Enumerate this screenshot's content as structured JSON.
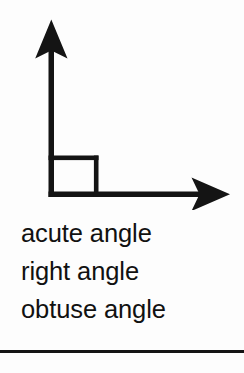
{
  "page": {
    "background_color": "#fdfdfd",
    "ink_color": "#111111",
    "width": 244,
    "height": 373
  },
  "diagram": {
    "name": "right-angle-axes-diagram",
    "stroke_color": "#141414",
    "vertical_arrow": {
      "name": "vertical-axis-arrow",
      "direction": "up",
      "tip_x": 52,
      "tip_y": 20,
      "base_x": 52,
      "base_y": 196
    },
    "horizontal_arrow": {
      "name": "horizontal-axis-arrow",
      "direction": "right",
      "tip_x": 230,
      "tip_y": 194,
      "base_x": 52,
      "base_y": 194
    },
    "right_angle_marker": {
      "name": "right-angle-square-marker",
      "x": 52,
      "y": 156,
      "size": 44
    }
  },
  "labels": {
    "name": "angle-type-label-list",
    "items": [
      {
        "id": "acute-angle",
        "text": "acute angle"
      },
      {
        "id": "right-angle",
        "text": "right angle"
      },
      {
        "id": "obtuse-angle",
        "text": "obtuse angle"
      }
    ]
  },
  "rule": {
    "name": "bottom-horizontal-rule",
    "color": "#141414",
    "thickness": 3
  }
}
